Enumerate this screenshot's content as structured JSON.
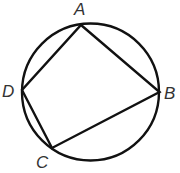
{
  "diagram": {
    "type": "cyclic-quadrilateral",
    "stroke_color": "#111111",
    "label_color": "#333333",
    "circle": {
      "cx": 90.5,
      "cy": 92,
      "r": 68.5
    },
    "points": {
      "A": {
        "label": "A",
        "x": 81,
        "y": 25
      },
      "B": {
        "label": "B",
        "x": 159.5,
        "y": 92
      },
      "C": {
        "label": "C",
        "x": 52,
        "y": 148
      },
      "D": {
        "label": "D",
        "x": 22,
        "y": 90
      }
    },
    "edges": [
      "AB",
      "BC",
      "CD",
      "DA"
    ]
  }
}
